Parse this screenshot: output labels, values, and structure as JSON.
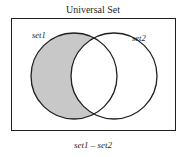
{
  "figure": {
    "title": "Universal Set",
    "caption": "set1 – set2",
    "background_color": "#ffffff",
    "line_color": "#1f1f1f",
    "shade_color": "#c8c8c8",
    "universe_box": {
      "label": "Universal Set",
      "x": 11,
      "y": 18,
      "width": 165,
      "height": 113,
      "border_width": 1
    },
    "sets": [
      {
        "name": "set1",
        "label": "set1",
        "cx": 74,
        "cy": 76,
        "r": 43,
        "fill": "#c8c8c8",
        "label_x": 32,
        "label_y": 38
      },
      {
        "name": "set2",
        "label": "set2",
        "cx": 114,
        "cy": 76,
        "r": 43,
        "fill": "#ffffff",
        "label_x": 132,
        "label_y": 41
      }
    ],
    "shaded_region": {
      "name": "set-difference",
      "description": "set1 minus set2",
      "fill": "#c8c8c8"
    },
    "title_x": 93,
    "title_y": 13,
    "caption_x": 93,
    "caption_y": 148
  }
}
